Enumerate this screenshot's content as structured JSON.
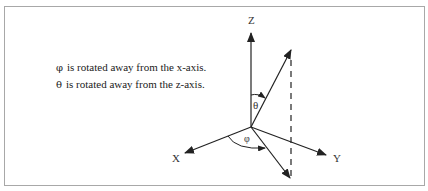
{
  "diagram": {
    "captions": [
      {
        "symbol": "φ",
        "text": "is rotated away from the x-axis."
      },
      {
        "symbol": "θ",
        "text": "is rotated away from the z-axis."
      }
    ],
    "axes": {
      "x_label": "X",
      "y_label": "Y",
      "z_label": "Z"
    },
    "angles": {
      "theta_label": "θ",
      "phi_label": "φ"
    },
    "colors": {
      "line": "#222222",
      "border": "#a8a8a8"
    }
  }
}
